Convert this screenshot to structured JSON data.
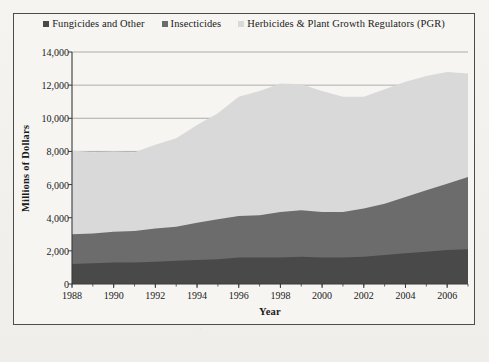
{
  "chart_data": {
    "type": "area",
    "stacked": true,
    "title": "",
    "xlabel": "Year",
    "ylabel": "Millions of Dollars",
    "ylim": [
      0,
      14000
    ],
    "ytick_labels": [
      "14,000",
      "12,000",
      "10,000",
      "8,000",
      "6,000",
      "4,000",
      "2,000",
      "0"
    ],
    "ytick_values": [
      14000,
      12000,
      10000,
      8000,
      6000,
      4000,
      2000,
      0
    ],
    "xlim": [
      1988,
      2007
    ],
    "xtick_labels": [
      "1988",
      "1990",
      "1992",
      "1994",
      "1996",
      "1998",
      "2000",
      "2002",
      "2004",
      "2006"
    ],
    "xtick_values": [
      1988,
      1990,
      1992,
      1994,
      1996,
      1998,
      2000,
      2002,
      2004,
      2006
    ],
    "grid": true,
    "legend_position": "top",
    "x": [
      1988,
      1989,
      1990,
      1991,
      1992,
      1993,
      1994,
      1995,
      1996,
      1997,
      1998,
      1999,
      2000,
      2001,
      2002,
      2003,
      2004,
      2005,
      2006,
      2007
    ],
    "series": [
      {
        "name": "Fungicides and Other",
        "color": "#494949",
        "values": [
          1200,
          1250,
          1300,
          1300,
          1350,
          1400,
          1450,
          1500,
          1600,
          1600,
          1600,
          1650,
          1600,
          1600,
          1650,
          1750,
          1850,
          1950,
          2050,
          2100
        ]
      },
      {
        "name": "Insecticides",
        "color": "#6c6c6c",
        "values": [
          1800,
          1800,
          1850,
          1900,
          2000,
          2050,
          2250,
          2400,
          2500,
          2550,
          2750,
          2800,
          2750,
          2750,
          2900,
          3100,
          3400,
          3700,
          4000,
          4350
        ]
      },
      {
        "name": "Herbicides & Plant Growth Regulators (PGR)",
        "color": "#d9d9d9",
        "values": [
          5050,
          4900,
          4850,
          4750,
          5050,
          5350,
          5900,
          6400,
          7200,
          7500,
          7750,
          7600,
          7300,
          6950,
          6750,
          6900,
          6950,
          6900,
          6750,
          6250
        ]
      }
    ],
    "totals": [
      8050,
      7950,
      8000,
      7950,
      8400,
      8800,
      9600,
      10300,
      11300,
      11650,
      12100,
      12050,
      11650,
      11300,
      11300,
      11750,
      12200,
      12550,
      12800,
      12700
    ]
  },
  "legend": {
    "items": [
      {
        "label": "Fungicides and Other",
        "color": "#494949"
      },
      {
        "label": "Insecticides",
        "color": "#6c6c6c"
      },
      {
        "label": "Herbicides & Plant Growth Regulators (PGR)",
        "color": "#d9d9d9"
      }
    ]
  },
  "axes": {
    "y_title": "Millions of Dollars",
    "x_title": "Year"
  },
  "colors": {
    "frame_border": "#4c4c4c",
    "grid_line": "#9a9a9a",
    "axis_line": "#3a3a3a",
    "plot_background": "#f6f5f2",
    "page_background": "#f3f2ef"
  }
}
